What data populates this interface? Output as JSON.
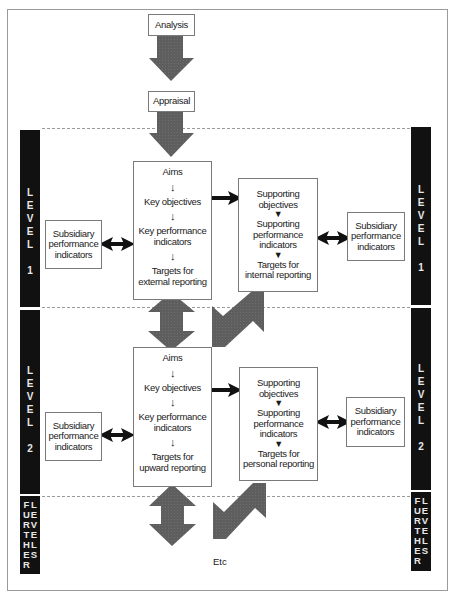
{
  "top": {
    "analysis": "Analysis",
    "appraisal": "Appraisal"
  },
  "side_labels": {
    "level1": [
      "L",
      "E",
      "V",
      "E",
      "L",
      "",
      "1"
    ],
    "level2": [
      "L",
      "E",
      "V",
      "E",
      "L",
      "",
      "2"
    ],
    "further_col1": [
      "F",
      "U",
      "R",
      "T",
      "H",
      "E",
      "R"
    ],
    "further_col2": [
      "L",
      "E",
      "V",
      "E",
      "L",
      "S"
    ]
  },
  "level1": {
    "main": {
      "aims": "Aims",
      "key_objectives": "Key objectives",
      "kpi_line1": "Key performance",
      "kpi_line2": "indicators",
      "targets_line1": "Targets for",
      "targets_line2": "external reporting"
    },
    "supporting": {
      "obj_line1": "Supporting",
      "obj_line2": "objectives",
      "perf_line1": "Supporting",
      "perf_line2": "performance",
      "perf_line3": "indicators",
      "targets_line1": "Targets for",
      "targets_line2": "internal reporting"
    },
    "subsidiary_left": [
      "Subsidiary",
      "performance",
      "indicators"
    ],
    "subsidiary_right": [
      "Subsidiary",
      "performance",
      "indicators"
    ]
  },
  "level2": {
    "main": {
      "aims": "Aims",
      "key_objectives": "Key objectives",
      "kpi_line1": "Key performance",
      "kpi_line2": "indicators",
      "targets_line1": "Targets for",
      "targets_line2": "upward reporting"
    },
    "supporting": {
      "obj_line1": "Supporting",
      "obj_line2": "objectives",
      "perf_line1": "Supporting",
      "perf_line2": "performance",
      "perf_line3": "indicators",
      "targets_line1": "Targets for",
      "targets_line2": "personal reporting"
    },
    "subsidiary_left": [
      "Subsidiary",
      "performance",
      "indicators"
    ],
    "subsidiary_right": [
      "Subsidiary",
      "performance",
      "indicators"
    ]
  },
  "footer": {
    "etc": "Etc"
  },
  "colors": {
    "block_arrow": "#5e5e5e",
    "side_bar": "#111111",
    "line_arrow": "#111111",
    "dash": "#9a9a9a"
  }
}
